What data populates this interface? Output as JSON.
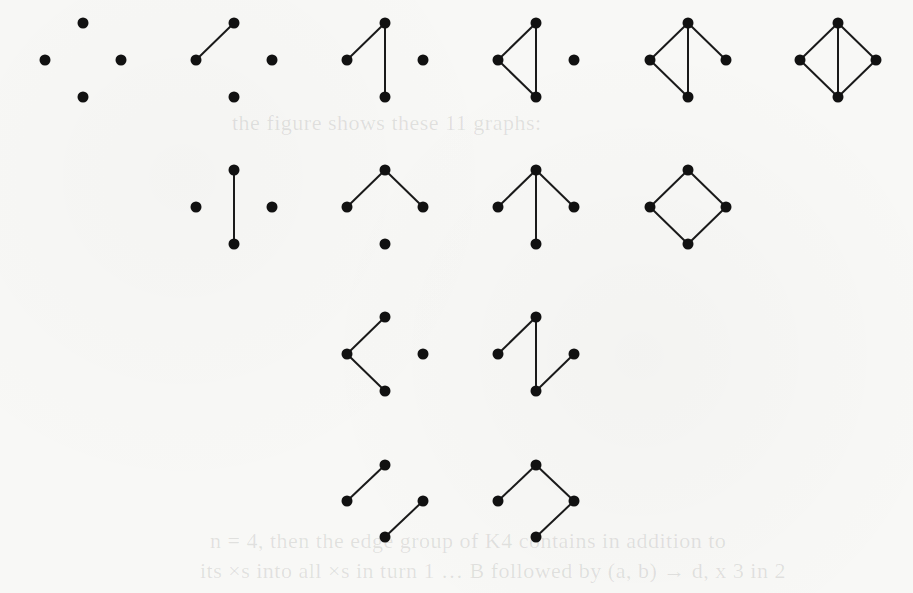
{
  "figure": {
    "node_color": "#111111",
    "edge_color": "#1a1a1a",
    "background": "#f8f8f6",
    "graphs": [
      {
        "id": "g1",
        "cx": 83,
        "row": 1,
        "edges": []
      },
      {
        "id": "g2",
        "cx": 234,
        "row": 1,
        "edges": [
          [
            "left",
            "top"
          ]
        ]
      },
      {
        "id": "g3",
        "cx": 385,
        "row": 1,
        "edges": [
          [
            "left",
            "top"
          ],
          [
            "top",
            "bottom"
          ]
        ]
      },
      {
        "id": "g4",
        "cx": 536,
        "row": 1,
        "edges": [
          [
            "left",
            "top"
          ],
          [
            "top",
            "bottom"
          ],
          [
            "left",
            "bottom"
          ]
        ]
      },
      {
        "id": "g5",
        "cx": 688,
        "row": 1,
        "edges": [
          [
            "left",
            "top"
          ],
          [
            "top",
            "bottom"
          ],
          [
            "left",
            "bottom"
          ],
          [
            "top",
            "right"
          ]
        ]
      },
      {
        "id": "g6",
        "cx": 838,
        "row": 1,
        "edges": [
          [
            "left",
            "top"
          ],
          [
            "top",
            "bottom"
          ],
          [
            "left",
            "bottom"
          ],
          [
            "top",
            "right"
          ],
          [
            "right",
            "bottom"
          ]
        ]
      },
      {
        "id": "g7",
        "cx": 234,
        "row": 2,
        "edges": [
          [
            "top",
            "bottom"
          ]
        ]
      },
      {
        "id": "g8",
        "cx": 385,
        "row": 2,
        "edges": [
          [
            "top",
            "left"
          ],
          [
            "top",
            "right"
          ]
        ]
      },
      {
        "id": "g9",
        "cx": 536,
        "row": 2,
        "edges": [
          [
            "top",
            "left"
          ],
          [
            "top",
            "right"
          ],
          [
            "top",
            "bottom"
          ]
        ]
      },
      {
        "id": "g10",
        "cx": 688,
        "row": 2,
        "edges": [
          [
            "top",
            "left"
          ],
          [
            "top",
            "right"
          ],
          [
            "left",
            "bottom"
          ],
          [
            "right",
            "bottom"
          ]
        ]
      },
      {
        "id": "g11",
        "cx": 385,
        "row": 3,
        "edges": [
          [
            "left",
            "top"
          ],
          [
            "left",
            "bottom"
          ]
        ]
      },
      {
        "id": "g12",
        "cx": 536,
        "row": 3,
        "edges": [
          [
            "left",
            "top"
          ],
          [
            "top",
            "bottom"
          ],
          [
            "bottom",
            "right"
          ]
        ]
      },
      {
        "id": "g13",
        "cx": 385,
        "row": 4,
        "edges": [
          [
            "left",
            "top"
          ],
          [
            "bottom",
            "right"
          ]
        ]
      },
      {
        "id": "g14",
        "cx": 536,
        "row": 4,
        "edges": [
          [
            "left",
            "top"
          ],
          [
            "top",
            "right"
          ],
          [
            "right",
            "bottom"
          ]
        ]
      }
    ],
    "rows": {
      "1": {
        "top": 23,
        "mid": 60,
        "bottom": 97
      },
      "2": {
        "top": 170,
        "mid": 207,
        "bottom": 244
      },
      "3": {
        "top": 317,
        "mid": 354,
        "bottom": 391
      },
      "4": {
        "top": 465,
        "mid": 501,
        "bottom": 537
      }
    },
    "half_width": 38,
    "node_radius": 5.5
  },
  "ghost_text": {
    "line1": "the figure shows these 11 graphs:",
    "line2": "n = 4, then the edge group of K4 contains in addition to",
    "line3": "its ×s into all ×s in turn 1 … B followed by (a, b) → d, x 3 in 2"
  }
}
